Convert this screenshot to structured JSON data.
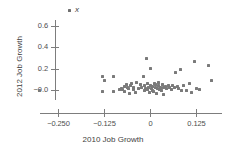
{
  "chart_data": {
    "type": "scatter",
    "title": "",
    "xlabel": "2010 Job Growth",
    "ylabel": "2012 Job Growth",
    "xlim": [
      -0.3,
      0.18
    ],
    "ylim": [
      -0.1,
      0.7
    ],
    "grid": false,
    "legend_position": "top-left-inside",
    "xticks": [
      -0.25,
      -0.125,
      0,
      0.125
    ],
    "xticklabels": [
      "−0.250",
      "−0.125",
      "0",
      "0.125"
    ],
    "yticks": [
      0.6,
      0.4,
      0.2,
      -0.0
    ],
    "yticklabels": [
      "0.6",
      "0.4",
      "0.2",
      "−0.0"
    ],
    "legend": [
      {
        "label": "x",
        "marker": "point",
        "color": "#6f6f6f"
      }
    ],
    "series": [
      {
        "name": "x",
        "color": "#7a7a7a",
        "points": [
          [
            -0.3,
            -0.005
          ],
          [
            -0.13,
            0.125
          ],
          [
            -0.125,
            0.085
          ],
          [
            -0.128,
            -0.012
          ],
          [
            -0.1,
            0.13
          ],
          [
            -0.098,
            -0.01
          ],
          [
            -0.082,
            0.006
          ],
          [
            -0.078,
            0.016
          ],
          [
            -0.074,
            0.002
          ],
          [
            -0.07,
            0.03
          ],
          [
            -0.068,
            -0.018
          ],
          [
            -0.065,
            0.05
          ],
          [
            -0.062,
            0.02
          ],
          [
            -0.058,
            0.012
          ],
          [
            -0.056,
            -0.032
          ],
          [
            -0.052,
            0.042
          ],
          [
            -0.05,
            0.06
          ],
          [
            -0.046,
            0.02
          ],
          [
            -0.044,
            0.004
          ],
          [
            -0.04,
            -0.022
          ],
          [
            -0.036,
            0.068
          ],
          [
            -0.03,
            0.01
          ],
          [
            -0.026,
            0.05
          ],
          [
            -0.022,
            0.022
          ],
          [
            -0.018,
            0.13
          ],
          [
            -0.016,
            -0.004
          ],
          [
            -0.014,
            0.04
          ],
          [
            -0.012,
            0.012
          ],
          [
            -0.01,
            0.295
          ],
          [
            -0.008,
            0.002
          ],
          [
            -0.006,
            0.058
          ],
          [
            -0.004,
            0.026
          ],
          [
            -0.002,
            -0.026
          ],
          [
            0.0,
            0.2
          ],
          [
            0.002,
            0.044
          ],
          [
            0.004,
            0.016
          ],
          [
            0.006,
            0.0
          ],
          [
            0.008,
            0.034
          ],
          [
            0.01,
            -0.01
          ],
          [
            0.012,
            0.062
          ],
          [
            0.014,
            0.024
          ],
          [
            0.016,
            0.048
          ],
          [
            0.018,
            -0.03
          ],
          [
            0.02,
            0.01
          ],
          [
            0.022,
            0.038
          ],
          [
            0.024,
            0.07
          ],
          [
            0.026,
            0.002
          ],
          [
            0.028,
            0.028
          ],
          [
            0.03,
            -0.006
          ],
          [
            0.034,
            0.052
          ],
          [
            0.036,
            0.02
          ],
          [
            0.038,
            -0.042
          ],
          [
            0.042,
            0.036
          ],
          [
            0.046,
            0.014
          ],
          [
            0.05,
            0.046
          ],
          [
            0.054,
            0.026
          ],
          [
            0.058,
            0.006
          ],
          [
            0.062,
            0.04
          ],
          [
            0.066,
            0.022
          ],
          [
            0.07,
            0.16
          ],
          [
            0.074,
            0.03
          ],
          [
            0.078,
            0.01
          ],
          [
            0.082,
            0.196
          ],
          [
            0.086,
            0.0
          ],
          [
            0.09,
            0.038
          ],
          [
            0.098,
            -0.006
          ],
          [
            0.106,
            0.06
          ],
          [
            0.112,
            -0.022
          ],
          [
            0.12,
            0.268
          ],
          [
            0.126,
            0.018
          ],
          [
            0.134,
            0.006
          ],
          [
            0.16,
            0.228
          ],
          [
            0.168,
            0.09
          ]
        ]
      }
    ]
  }
}
